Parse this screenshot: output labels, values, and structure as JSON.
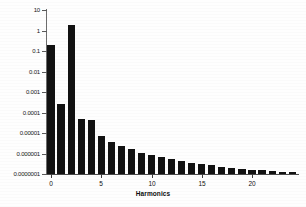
{
  "chart_data": {
    "type": "bar",
    "title": "",
    "subtitle": "",
    "xlabel": "Harmonics",
    "ylabel": "",
    "yscale": "log",
    "ylim": [
      1e-07,
      10
    ],
    "xlim": [
      -0.5,
      24.5
    ],
    "grid": false,
    "legend": null,
    "y_tick_labels": [
      "10",
      "1",
      "0.1",
      "0.01",
      "0.001",
      "0.0001",
      "0.00001",
      "0.000001",
      "0.0000001"
    ],
    "y_tick_values": [
      10,
      1,
      0.1,
      0.01,
      0.001,
      0.0001,
      1e-05,
      1e-06,
      1e-07
    ],
    "x_tick_labels": [
      "0",
      "5",
      "10",
      "15",
      "20"
    ],
    "x_tick_values": [
      0,
      5,
      10,
      15,
      20
    ],
    "categories": [
      0,
      1,
      2,
      3,
      4,
      5,
      6,
      7,
      8,
      9,
      10,
      11,
      12,
      13,
      14,
      15,
      16,
      17,
      18,
      19,
      20,
      21,
      22,
      23,
      24
    ],
    "values": [
      0.2,
      0.00025,
      1.8,
      5e-05,
      4.2e-05,
      7.2e-06,
      3.8e-06,
      2.4e-06,
      1.7e-06,
      1.1e-06,
      8.5e-07,
      6.8e-07,
      5.2e-07,
      4.3e-07,
      3.6e-07,
      3e-07,
      2.6e-07,
      2.3e-07,
      2e-07,
      1.7e-07,
      1.6e-07,
      1.5e-07,
      1.4e-07,
      1.3e-07,
      1.2e-07
    ],
    "bar_color": "#121212",
    "axis_color": "#4a4a4a",
    "background_color": "#ffffff"
  },
  "figure": {
    "xaxis_title": "Harmonics"
  }
}
